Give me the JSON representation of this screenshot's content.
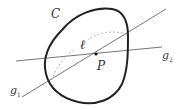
{
  "figure": {
    "curve_label": "C",
    "point_label": "P",
    "dashed_curve_label": "ℓ",
    "line1": {
      "name": "g",
      "subscript": "1"
    },
    "line2": {
      "name": "g",
      "subscript": "2"
    }
  },
  "colors": {
    "curve": "#222222",
    "lines": "#666666",
    "dashed": "#aaaaaa",
    "point": "#111111",
    "text": "#333333"
  }
}
